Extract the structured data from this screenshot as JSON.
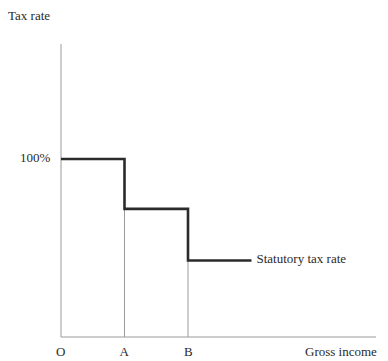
{
  "chart_data": {
    "type": "line",
    "title": "",
    "xlabel": "Gross income",
    "ylabel": "Tax rate",
    "origin_label": "O",
    "x_ticks": [
      {
        "label": "A",
        "value": 1
      },
      {
        "label": "B",
        "value": 2
      }
    ],
    "y_ticks": [
      {
        "label": "100%",
        "value": 100
      }
    ],
    "xlim": [
      0,
      4.2
    ],
    "ylim": [
      0,
      140
    ],
    "series": [
      {
        "name": "Statutory tax rate",
        "step": true,
        "points": [
          {
            "x": 0,
            "y": 100
          },
          {
            "x": 1,
            "y": 100
          },
          {
            "x": 1,
            "y": 72
          },
          {
            "x": 2,
            "y": 72
          },
          {
            "x": 2,
            "y": 43
          },
          {
            "x": 3,
            "y": 43
          }
        ]
      }
    ],
    "guide_lines_at_x": [
      1,
      2
    ],
    "grid": false,
    "legend": "inline-right-of-line"
  }
}
